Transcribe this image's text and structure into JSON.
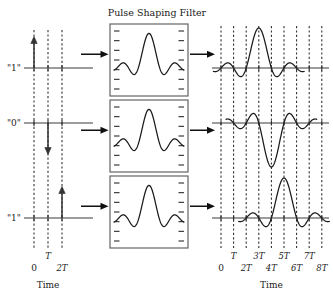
{
  "figure": {
    "title": "Pulse Shaping Filter"
  },
  "left_panel": {
    "time_axis_label": "Time",
    "bit_labels": [
      "\"1\"",
      "\"0\"",
      "\"1\""
    ],
    "tick_labels_upper": [
      "T"
    ],
    "tick_labels_lower": [
      "0",
      "2T"
    ],
    "gridline_count": 3,
    "impulses": [
      {
        "row": 0,
        "bit": "\"1\"",
        "time": "0",
        "direction": "up"
      },
      {
        "row": 1,
        "bit": "\"0\"",
        "time": "T",
        "direction": "down"
      },
      {
        "row": 2,
        "bit": "\"1\"",
        "time": "2T",
        "direction": "up"
      }
    ]
  },
  "filter_blocks": {
    "count": 3,
    "content_icon": "sinc-pulse-icon",
    "tick_marks_per_side": 7
  },
  "right_panel": {
    "time_axis_label": "Time",
    "tick_labels_upper": [
      "T",
      "3T",
      "5T",
      "7T"
    ],
    "tick_labels_lower": [
      "0",
      "2T",
      "4T",
      "6T",
      "8T"
    ],
    "gridline_count": 9,
    "outputs": [
      {
        "row": 0,
        "shape": "sinc",
        "polarity": "positive",
        "center_time": "3T"
      },
      {
        "row": 1,
        "shape": "sinc",
        "polarity": "negative",
        "center_time": "4T"
      },
      {
        "row": 2,
        "shape": "sinc",
        "polarity": "positive",
        "center_time": "5T"
      }
    ]
  },
  "colors": {
    "line": "#1a1a1a",
    "axis": "#3b3b3b",
    "dash": "#2a2a2a",
    "box_border": "#555555",
    "background": "#ffffff"
  }
}
